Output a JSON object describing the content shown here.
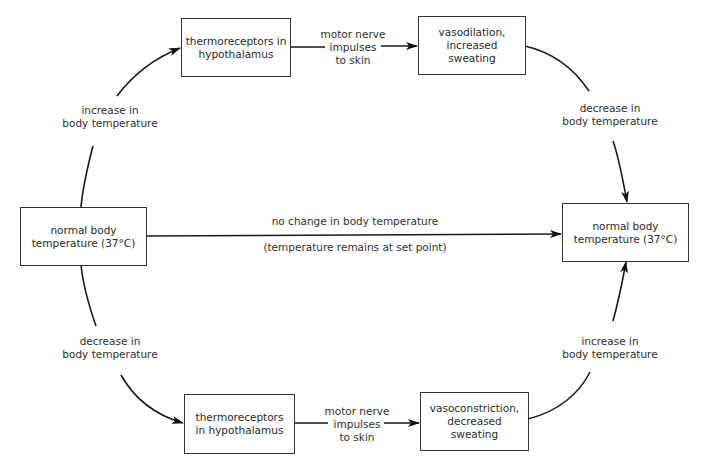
{
  "diagram": {
    "type": "feedback-loop",
    "nodes": {
      "normal_left": "normal body\ntemperature (37°C)",
      "normal_right": "normal body\ntemperature (37°C)",
      "thermo_top": "thermoreceptors in\nhypothalamus",
      "effect_top": "vasodilation,\nincreased\nsweating",
      "thermo_bottom": "thermoreceptors\nin hypothalamus",
      "effect_bottom": "vasoconstriction,\ndecreased\nsweating"
    },
    "edge_labels": {
      "top_left_arc": "increase in\nbody temperature",
      "top_middle": "motor nerve\nimpulses\nto skin",
      "top_right_arc": "decrease in\nbody temperature",
      "center_above": "no change in body temperature",
      "center_below": "(temperature remains at set point)",
      "bottom_left_arc": "decrease in\nbody temperature",
      "bottom_middle": "motor nerve\nimpulses\nto skin",
      "bottom_right_arc": "increase in\nbody temperature"
    },
    "colors": {
      "line": "#1a1a1a",
      "text": "#2f2f2f",
      "background": "#ffffff"
    }
  }
}
